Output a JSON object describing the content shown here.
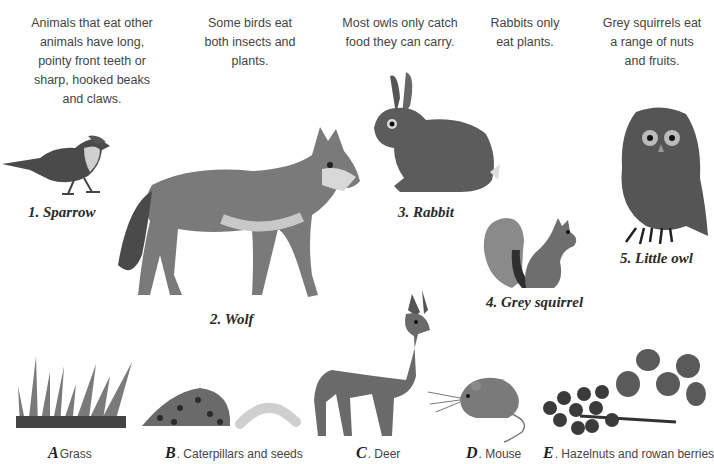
{
  "captions": [
    {
      "text": "Animals that eat other animals have long, pointy front teeth or sharp, hooked beaks and claws."
    },
    {
      "text": "Some birds eat both insects and plants."
    },
    {
      "text": "Most owls only catch food they can carry."
    },
    {
      "text": "Rabbits only eat plants."
    },
    {
      "text": "Grey squirrels eat a range of nuts and fruits."
    }
  ],
  "animals": [
    {
      "number": "1.",
      "name": "Sparrow",
      "label": "1. Sparrow"
    },
    {
      "number": "2.",
      "name": "Wolf",
      "label": "2. Wolf"
    },
    {
      "number": "3.",
      "name": "Rabbit",
      "label": "3. Rabbit"
    },
    {
      "number": "4.",
      "name": "Grey squirrel",
      "label": "4. Grey squirrel"
    },
    {
      "number": "5.",
      "name": "Little owl",
      "label": "5. Little owl"
    }
  ],
  "foods": [
    {
      "letter": "A",
      "name": "Grass"
    },
    {
      "letter": "B",
      "name": ". Caterpillars and seeds"
    },
    {
      "letter": "C",
      "name": ". Deer"
    },
    {
      "letter": "D",
      "name": ". Mouse"
    },
    {
      "letter": "E",
      "name": ". Hazelnuts and rowan berries"
    }
  ]
}
